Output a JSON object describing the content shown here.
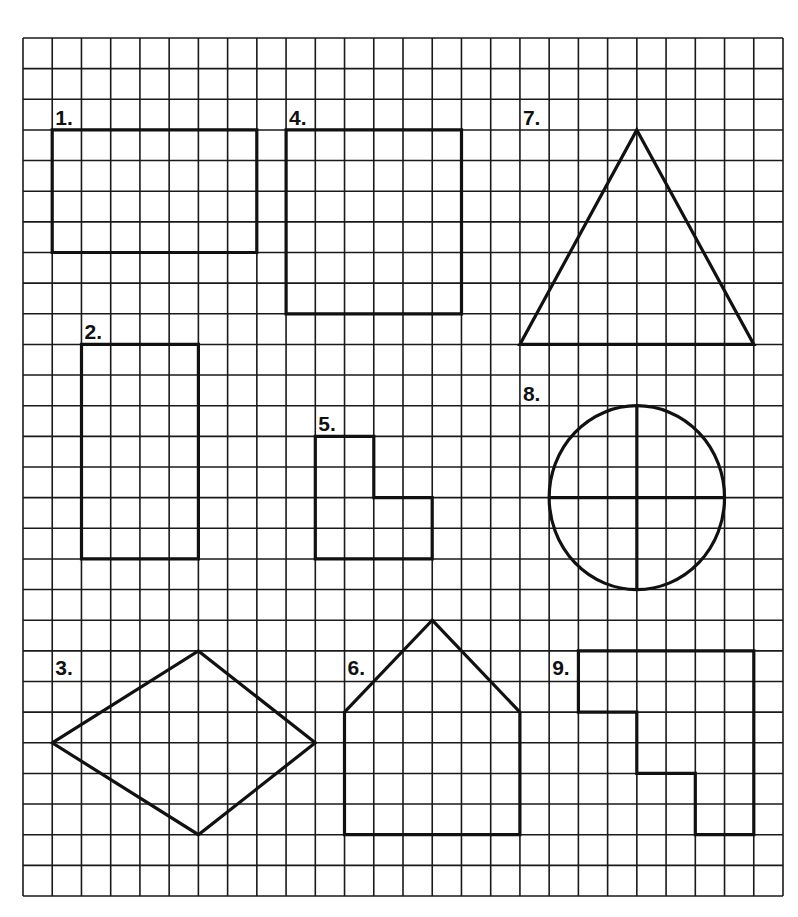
{
  "grid": {
    "columns": 26,
    "rows": 28,
    "line_color": "#1a1a1a",
    "shape_color": "#111111"
  },
  "shapes": [
    {
      "id": 1,
      "label": "1.",
      "kind": "rectangle"
    },
    {
      "id": 2,
      "label": "2.",
      "kind": "rectangle"
    },
    {
      "id": 3,
      "label": "3.",
      "kind": "rhombus"
    },
    {
      "id": 4,
      "label": "4.",
      "kind": "rectangle"
    },
    {
      "id": 5,
      "label": "5.",
      "kind": "l-shape"
    },
    {
      "id": 6,
      "label": "6.",
      "kind": "pentagon-house"
    },
    {
      "id": 7,
      "label": "7.",
      "kind": "triangle"
    },
    {
      "id": 8,
      "label": "8.",
      "kind": "circle-quartered"
    },
    {
      "id": 9,
      "label": "9.",
      "kind": "step-polygon"
    }
  ]
}
